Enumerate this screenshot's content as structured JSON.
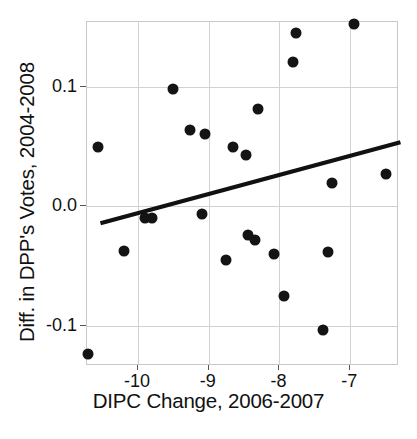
{
  "chart_data": {
    "type": "scatter",
    "title": "",
    "xlabel": "DIPC Change, 2006-2007",
    "ylabel": "Diff. in DPP's Votes, 2004-2008",
    "xlim": [
      -10.72,
      -6.31
    ],
    "ylim": [
      -0.134,
      0.155
    ],
    "xticks": [
      -10,
      -9,
      -8,
      -7
    ],
    "xticklabels": [
      "-10",
      "-9",
      "-8",
      "-7"
    ],
    "yticks": [
      0.1,
      0.0,
      -0.1
    ],
    "yticklabels": [
      "0.1",
      "0.0",
      "-0.1"
    ],
    "grid": true,
    "legend": "none",
    "marker": "filled-circle",
    "marker_color": "#141414",
    "points": [
      {
        "x": -10.56,
        "y": 0.05
      },
      {
        "x": -10.7,
        "y": -0.124
      },
      {
        "x": -10.19,
        "y": -0.037
      },
      {
        "x": -9.9,
        "y": -0.01
      },
      {
        "x": -9.8,
        "y": -0.01
      },
      {
        "x": -9.5,
        "y": 0.099
      },
      {
        "x": -9.27,
        "y": 0.064
      },
      {
        "x": -9.05,
        "y": 0.061
      },
      {
        "x": -9.09,
        "y": -0.006
      },
      {
        "x": -8.76,
        "y": -0.045
      },
      {
        "x": -8.65,
        "y": 0.05
      },
      {
        "x": -8.47,
        "y": 0.043
      },
      {
        "x": -8.45,
        "y": -0.024
      },
      {
        "x": -8.35,
        "y": -0.028
      },
      {
        "x": -8.31,
        "y": 0.082
      },
      {
        "x": -8.08,
        "y": -0.04
      },
      {
        "x": -7.93,
        "y": -0.075
      },
      {
        "x": -7.81,
        "y": 0.121
      },
      {
        "x": -7.77,
        "y": 0.146
      },
      {
        "x": -7.38,
        "y": -0.104
      },
      {
        "x": -7.32,
        "y": -0.038
      },
      {
        "x": -7.25,
        "y": 0.02
      },
      {
        "x": -6.94,
        "y": 0.153
      },
      {
        "x": -6.5,
        "y": 0.027
      }
    ],
    "fit_line": {
      "type": "linear-regression",
      "x_start": -10.53,
      "y_start": -0.014,
      "x_end": -6.29,
      "y_end": 0.054
    }
  }
}
